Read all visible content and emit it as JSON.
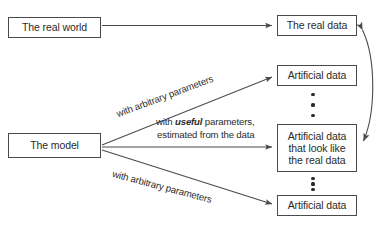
{
  "diagram": {
    "stroke_color": "#4a4a4a",
    "text_color": "#2b2b2b",
    "background_color": "#ffffff",
    "nodes": {
      "real_world": {
        "label": "The real world"
      },
      "model": {
        "label": "The model"
      },
      "real_data": {
        "label": "The real data"
      },
      "artificial_top": {
        "label": "Artificial data"
      },
      "artificial_middle": {
        "line1": "Artificial data",
        "line2": "that look like",
        "line3": "the real data"
      },
      "artificial_bottom": {
        "label": "Artificial data"
      }
    },
    "edge_labels": {
      "arbitrary_upper": "with arbitrary parameters",
      "useful_prefix": "with ",
      "useful_emphasis": "useful",
      "useful_suffix": " parameters,",
      "useful_line2": "estimated from the data",
      "arbitrary_lower": "with arbitrary parameters"
    },
    "ellipsis": {
      "upper_count": 3,
      "lower_count": 3,
      "glyph": "vertical-dots"
    }
  }
}
